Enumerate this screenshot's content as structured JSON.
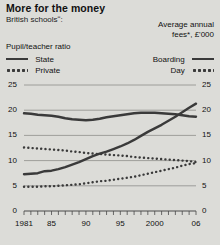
{
  "header": {
    "title": "More for the money",
    "subtitle": "British schoolsʺ:"
  },
  "legend": {
    "left_title": "Pupil/teacher ratio",
    "right_title_line1": "Average annual",
    "right_title_line2": "fees*, £'000",
    "left_items": [
      {
        "label": "State",
        "style": "solid",
        "key": "state-key-icon"
      },
      {
        "label": "Private",
        "style": "dotted",
        "key": "private-key-icon"
      }
    ],
    "right_items": [
      {
        "label": "Boarding",
        "style": "solid",
        "key": "boarding-key-icon"
      },
      {
        "label": "Day",
        "style": "dotted",
        "key": "day-key-icon"
      }
    ]
  },
  "chart_data": {
    "type": "line",
    "title": "More for the money",
    "subtitle": "British schoolsʺ:",
    "xlabel": "",
    "ylabel": "",
    "grid": true,
    "legend_position": "top",
    "xlim": [
      1981,
      2006
    ],
    "ylim": [
      0,
      25
    ],
    "left_axis": {
      "label": "Pupil/teacher ratio",
      "ticks": [
        0,
        5,
        10,
        15,
        20,
        25
      ],
      "tick_labels": [
        "0",
        "5",
        "10",
        "15",
        "20",
        "25"
      ]
    },
    "right_axis": {
      "label": "Average annual fees*, £'000",
      "ticks": [
        0,
        5,
        10,
        15,
        20,
        25
      ],
      "tick_labels": [
        "0",
        "5",
        "10",
        "15",
        "20",
        "25"
      ]
    },
    "x": [
      1981,
      1982,
      1983,
      1984,
      1985,
      1986,
      1987,
      1988,
      1989,
      1990,
      1991,
      1992,
      1993,
      1994,
      1995,
      1996,
      1997,
      1998,
      1999,
      2000,
      2001,
      2002,
      2003,
      2004,
      2005,
      2006
    ],
    "xtick_positions": [
      1981,
      1985,
      1990,
      1995,
      2000,
      2006
    ],
    "xtick_labels": [
      "1981",
      "85",
      "90",
      "95",
      "2000",
      "06"
    ],
    "series": [
      {
        "name": "State",
        "axis": "left",
        "style": "solid",
        "color": "#3a3a3a",
        "values": [
          19.4,
          19.3,
          19.1,
          19.0,
          18.9,
          18.7,
          18.4,
          18.2,
          18.1,
          18.0,
          18.1,
          18.3,
          18.6,
          18.8,
          19.0,
          19.2,
          19.4,
          19.5,
          19.5,
          19.5,
          19.4,
          19.3,
          19.2,
          19.0,
          18.8,
          18.7
        ]
      },
      {
        "name": "Private",
        "axis": "left",
        "style": "dotted",
        "color": "#3a3a3a",
        "values": [
          12.6,
          12.5,
          12.4,
          12.3,
          12.2,
          12.1,
          12.0,
          11.8,
          11.7,
          11.5,
          11.4,
          11.3,
          11.2,
          11.1,
          11.0,
          10.9,
          10.7,
          10.6,
          10.5,
          10.4,
          10.3,
          10.2,
          10.1,
          10.0,
          9.9,
          9.7
        ]
      },
      {
        "name": "Boarding",
        "axis": "right",
        "style": "solid",
        "color": "#3a3a3a",
        "values": [
          7.3,
          7.4,
          7.5,
          7.9,
          8.0,
          8.3,
          8.7,
          9.2,
          9.7,
          10.3,
          10.9,
          11.4,
          11.8,
          12.3,
          12.8,
          13.4,
          14.1,
          14.9,
          15.7,
          16.4,
          17.1,
          17.9,
          18.7,
          19.6,
          20.5,
          21.3
        ]
      },
      {
        "name": "Day",
        "axis": "right",
        "style": "dotted",
        "color": "#3a3a3a",
        "values": [
          4.8,
          4.8,
          4.8,
          4.9,
          4.9,
          5.0,
          5.1,
          5.2,
          5.3,
          5.5,
          5.7,
          5.9,
          6.0,
          6.2,
          6.4,
          6.6,
          6.8,
          7.1,
          7.4,
          7.7,
          8.0,
          8.3,
          8.6,
          9.0,
          9.3,
          9.5
        ]
      }
    ]
  }
}
